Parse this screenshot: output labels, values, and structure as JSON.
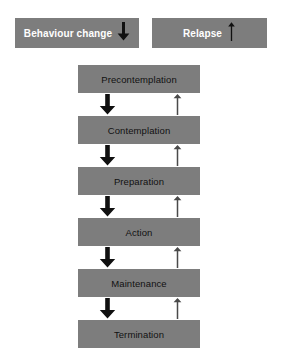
{
  "diagram": {
    "colors": {
      "box_fill": "#7d7d7d",
      "background": "#ffffff",
      "legend_text": "#ffffff",
      "stage_text": "#111111",
      "down_arrow": "#101010",
      "up_arrow": "#4a4a4a"
    }
  },
  "legend": {
    "items": [
      {
        "label": "Behaviour change",
        "arrow_icon": "arrow-down-icon",
        "arrow_direction": "down"
      },
      {
        "label": "Relapse",
        "arrow_icon": "arrow-up-icon",
        "arrow_direction": "up"
      }
    ]
  },
  "stages": [
    {
      "label": "Precontemplation"
    },
    {
      "label": "Contemplation"
    },
    {
      "label": "Preparation"
    },
    {
      "label": "Action"
    },
    {
      "label": "Maintenance"
    },
    {
      "label": "Termination"
    }
  ],
  "connectors": {
    "progress_arrows": [
      {
        "from": "Precontemplation",
        "to": "Contemplation",
        "icon": "arrow-down-icon"
      },
      {
        "from": "Contemplation",
        "to": "Preparation",
        "icon": "arrow-down-icon"
      },
      {
        "from": "Preparation",
        "to": "Action",
        "icon": "arrow-down-icon"
      },
      {
        "from": "Action",
        "to": "Maintenance",
        "icon": "arrow-down-icon"
      },
      {
        "from": "Maintenance",
        "to": "Termination",
        "icon": "arrow-down-icon"
      }
    ],
    "relapse_arrows": [
      {
        "from": "Contemplation",
        "to": "Precontemplation",
        "icon": "arrow-up-icon"
      },
      {
        "from": "Preparation",
        "to": "Contemplation",
        "icon": "arrow-up-icon"
      },
      {
        "from": "Action",
        "to": "Preparation",
        "icon": "arrow-up-icon"
      },
      {
        "from": "Maintenance",
        "to": "Action",
        "icon": "arrow-up-icon"
      },
      {
        "from": "Termination",
        "to": "Maintenance",
        "icon": "arrow-up-icon"
      }
    ]
  }
}
